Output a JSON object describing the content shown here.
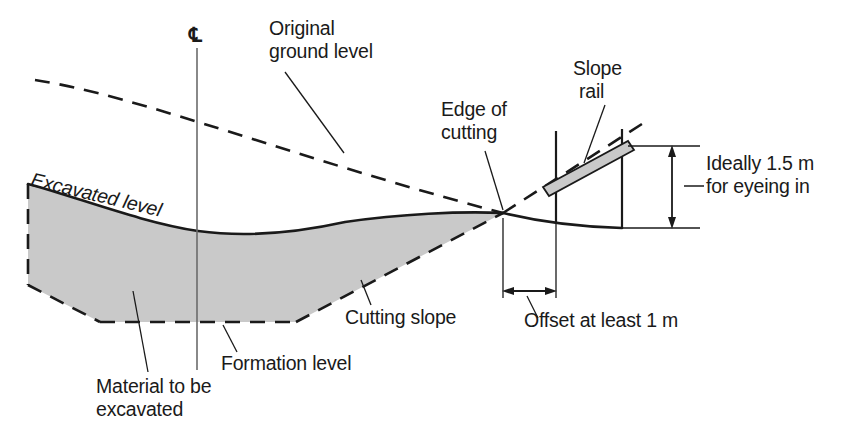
{
  "figure": {
    "type": "engineering-cross-section-diagram",
    "background_color": "#ffffff",
    "line_color": "#1a1a1a",
    "fill_gray": "#c9c9c9"
  },
  "labels": {
    "centre_line_symbol": "℄",
    "original_ground_level_line1": "Original",
    "original_ground_level_line2": "ground level",
    "excavated_level": "Excavated level",
    "edge_of_cutting_line1": "Edge of",
    "edge_of_cutting_line2": "cutting",
    "slope_rail_line1": "Slope",
    "slope_rail_line2": "rail",
    "ideally_line1": "Ideally 1.5 m",
    "ideally_line2": "for eyeing in",
    "offset": "Offset at least 1 m",
    "cutting_slope": "Cutting slope",
    "formation_level": "Formation level",
    "material_line1": "Material to be",
    "material_line2": "excavated"
  },
  "dimensions": {
    "vertical_height": "1.5 m",
    "horizontal_offset": "1 m"
  },
  "elements": {
    "centre_line": "vertical centre line",
    "original_ground_level": "dashed line descending left to right",
    "excavated_level": "solid curve forming top of excavation",
    "formation_level": "dashed horizontal base of excavation",
    "cutting_slope": "dashed inclined side of excavation",
    "slope_rail": "inclined gray rail board on two posts",
    "excavation_fill": "gray shaded material to be excavated"
  }
}
